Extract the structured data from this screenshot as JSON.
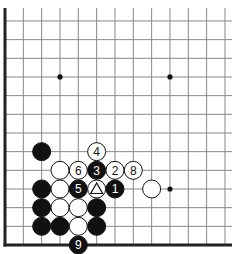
{
  "board": {
    "type": "go-diagram-partial",
    "grid": {
      "origin_x": 5,
      "spacing_x": 18.33,
      "bottom_y": 245,
      "spacing_y": 18.67,
      "columns_visible": 13,
      "rows_visible": 13,
      "left_edge": true,
      "bottom_edge": true,
      "line_color": "#888888",
      "edge_color": "#222222"
    },
    "star_points": [
      {
        "col": 3,
        "row": 9
      },
      {
        "col": 9,
        "row": 9
      },
      {
        "col": 9,
        "row": 3
      }
    ],
    "stones": [
      {
        "color": "black",
        "col": 2,
        "row": 5,
        "label": ""
      },
      {
        "color": "white",
        "col": 5,
        "row": 5,
        "label": "4"
      },
      {
        "color": "white",
        "col": 3,
        "row": 4,
        "label": ""
      },
      {
        "color": "white",
        "col": 4,
        "row": 4,
        "label": "6"
      },
      {
        "color": "black",
        "col": 5,
        "row": 4,
        "label": "3"
      },
      {
        "color": "white",
        "col": 6,
        "row": 4,
        "label": "2"
      },
      {
        "color": "white",
        "col": 7,
        "row": 4,
        "label": "8"
      },
      {
        "color": "black",
        "col": 2,
        "row": 3,
        "label": ""
      },
      {
        "color": "white",
        "col": 3,
        "row": 3,
        "label": ""
      },
      {
        "color": "black",
        "col": 4,
        "row": 3,
        "label": "5"
      },
      {
        "color": "white",
        "col": 5,
        "row": 3,
        "label": "",
        "marker": "triangle"
      },
      {
        "color": "black",
        "col": 6,
        "row": 3,
        "label": "1"
      },
      {
        "color": "white",
        "col": 8,
        "row": 3,
        "label": ""
      },
      {
        "color": "black",
        "col": 2,
        "row": 2,
        "label": ""
      },
      {
        "color": "white",
        "col": 3,
        "row": 2,
        "label": ""
      },
      {
        "color": "white",
        "col": 4,
        "row": 2,
        "label": ""
      },
      {
        "color": "black",
        "col": 5,
        "row": 2,
        "label": ""
      },
      {
        "color": "black",
        "col": 2,
        "row": 1,
        "label": ""
      },
      {
        "color": "black",
        "col": 3,
        "row": 1,
        "label": ""
      },
      {
        "color": "white",
        "col": 4,
        "row": 1,
        "label": ""
      },
      {
        "color": "black",
        "col": 5,
        "row": 1,
        "label": ""
      },
      {
        "color": "black",
        "col": 4,
        "row": 0,
        "label": "9"
      }
    ]
  }
}
